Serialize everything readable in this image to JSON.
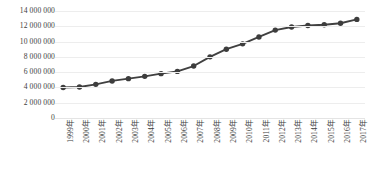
{
  "chart_data": {
    "type": "line",
    "title": "",
    "xlabel": "",
    "ylabel": "",
    "grid": true,
    "legend": "none",
    "ylim": [
      0,
      14000000
    ],
    "ytick_step": 2000000,
    "yticks": [
      "14 000 000",
      "12 000 000",
      "10 000 000",
      "8 000 000",
      "6 000 000",
      "4 000 000",
      "2 000 000",
      "0"
    ],
    "ytick_values": [
      14000000,
      12000000,
      10000000,
      8000000,
      6000000,
      4000000,
      2000000,
      0
    ],
    "categories": [
      "1999年",
      "2000年",
      "2001年",
      "2002年",
      "2003年",
      "2004年",
      "2005年",
      "2006年",
      "2007年",
      "2008年",
      "2009年",
      "2010年",
      "2011年",
      "2012年",
      "2013年",
      "2014年",
      "2015年",
      "2016年",
      "2017年"
    ],
    "values": [
      4000000,
      4050000,
      4400000,
      4850000,
      5150000,
      5450000,
      5800000,
      6100000,
      6800000,
      8000000,
      9000000,
      9700000,
      10600000,
      11500000,
      11900000,
      12100000,
      12200000,
      12400000,
      12900000
    ],
    "series": [
      {
        "name": "series-1",
        "color": "#404040",
        "marker": "circle",
        "values": [
          4000000,
          4050000,
          4400000,
          4850000,
          5150000,
          5450000,
          5800000,
          6100000,
          6800000,
          8000000,
          9000000,
          9700000,
          10600000,
          11500000,
          11900000,
          12100000,
          12200000,
          12400000,
          12900000
        ]
      }
    ]
  },
  "style": {
    "line_color": "#404040",
    "marker_color": "#3d3d3d",
    "grid_color": "#ededed",
    "text_color": "#3d3d3d",
    "background": "#ffffff"
  }
}
